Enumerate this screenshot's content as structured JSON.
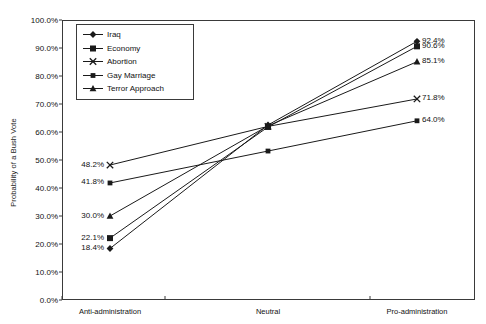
{
  "chart_data": {
    "type": "line",
    "title": "",
    "xlabel": "",
    "ylabel": "Probability of a Bush Vote",
    "categories": [
      "Anti-administration",
      "Neutral",
      "Pro-administration"
    ],
    "ylim": [
      0,
      100
    ],
    "ytick_labels": [
      "100.0%",
      "90.0%",
      "80.0%",
      "70.0%",
      "60.0%",
      "50.0%",
      "40.0%",
      "30.0%",
      "20.0%",
      "10.0%",
      "0.0%"
    ],
    "ytick_values": [
      100,
      90,
      80,
      70,
      60,
      50,
      40,
      30,
      20,
      10,
      0
    ],
    "grid": false,
    "legend_position": "top-left-inside",
    "series": [
      {
        "name": "Iraq",
        "marker": "diamond",
        "values": [
          18.4,
          62.5,
          92.4
        ],
        "start_label": "18.4%",
        "end_label": "92.4%"
      },
      {
        "name": "Economy",
        "marker": "square",
        "values": [
          22.1,
          61.8,
          90.6
        ],
        "start_label": "22.1%",
        "end_label": "90.6%"
      },
      {
        "name": "Abortion",
        "marker": "x",
        "values": [
          48.2,
          62.0,
          71.8
        ],
        "start_label": "48.2%",
        "end_label": "71.8%"
      },
      {
        "name": "Gay Marriage",
        "marker": "small-square",
        "values": [
          41.8,
          53.2,
          64.0
        ],
        "start_label": "41.8%",
        "end_label": "64.0%"
      },
      {
        "name": "Terror Approach",
        "marker": "triangle",
        "values": [
          30.0,
          62.2,
          85.1
        ],
        "start_label": "30.0%",
        "end_label": "85.1%"
      }
    ],
    "colors": {
      "line": "#1a1a1a",
      "frame": "#3a3a3a",
      "background": "#ffffff"
    }
  },
  "legend": {
    "items": [
      {
        "label": "Iraq"
      },
      {
        "label": "Economy"
      },
      {
        "label": "Abortion"
      },
      {
        "label": "Gay Marriage"
      },
      {
        "label": "Terror Approach"
      }
    ]
  }
}
